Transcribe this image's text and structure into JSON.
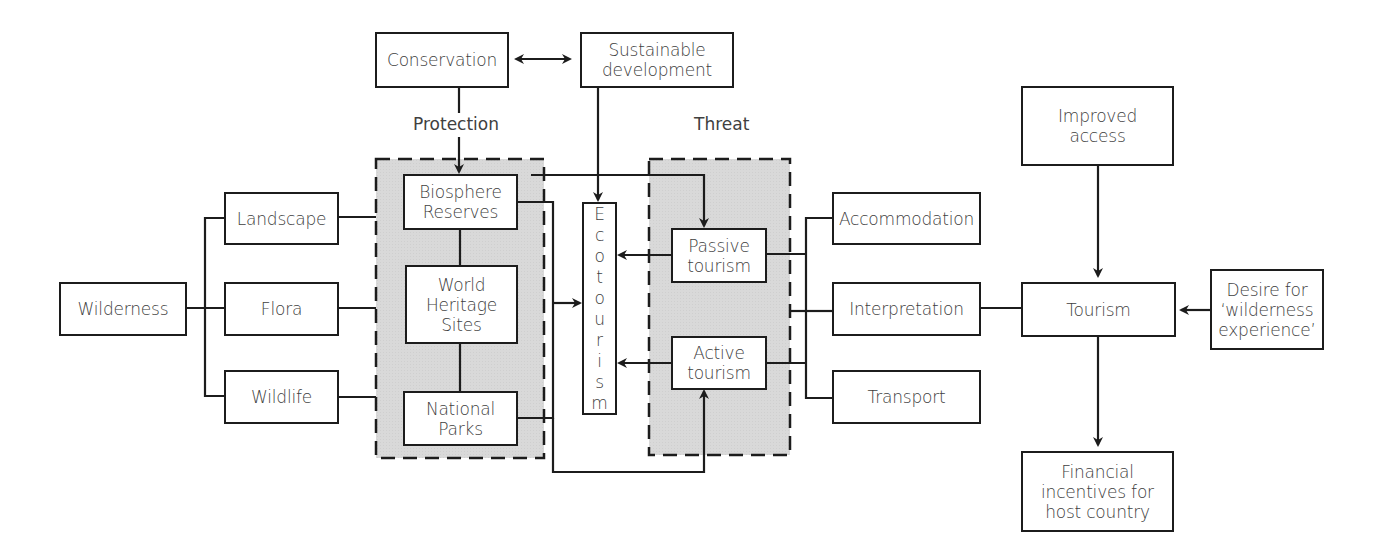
{
  "diagram": {
    "nodes": {
      "conservation": "Conservation",
      "sustainable_development": "Sustainable\ndevelopment",
      "biosphere_reserves": "Biosphere\nReserves",
      "world_heritage_sites": "World\nHeritage\nSites",
      "national_parks": "National\nParks",
      "ecotourism": "Ecotourism",
      "passive_tourism": "Passive\ntourism",
      "active_tourism": "Active\ntourism",
      "wilderness": "Wilderness",
      "landscape": "Landscape",
      "flora": "Flora",
      "wildlife": "Wildlife",
      "accommodation": "Accommodation",
      "interpretation": "Interpretation",
      "transport": "Transport",
      "tourism": "Tourism",
      "improved_access": "Improved\naccess",
      "desire": "Desire for\n‘wilderness\nexperience’",
      "financial": "Financial\nincentives for\nhost country"
    },
    "labels": {
      "protection": "Protection",
      "threat": "Threat"
    },
    "edges": [
      {
        "from": "Conservation",
        "to": "Sustainable development",
        "type": "bidirectional"
      },
      {
        "from": "Conservation",
        "to": "Biosphere Reserves",
        "label": "Protection"
      },
      {
        "from": "Sustainable development",
        "to": "Ecotourism"
      },
      {
        "from": "Biosphere Reserves",
        "to": "Passive tourism"
      },
      {
        "from": "National Parks",
        "to": "Active tourism"
      },
      {
        "from": "Protected areas",
        "to": "Ecotourism"
      },
      {
        "from": "Passive tourism",
        "to": "Ecotourism"
      },
      {
        "from": "Active tourism",
        "to": "Ecotourism"
      },
      {
        "from": "Wilderness",
        "to": [
          "Landscape",
          "Flora",
          "Wildlife"
        ],
        "type": "bracket"
      },
      {
        "from": [
          "Accommodation",
          "Interpretation",
          "Transport"
        ],
        "to": "Tourism",
        "type": "bracket"
      },
      {
        "from": "Improved access",
        "to": "Tourism"
      },
      {
        "from": "Desire for ‘wilderness experience’",
        "to": "Tourism"
      },
      {
        "from": "Tourism",
        "to": "Financial incentives for host country"
      }
    ],
    "colors": {
      "line": "#1c1c1c",
      "zone_fill": "#d9d9d9",
      "text": "#404040"
    }
  }
}
